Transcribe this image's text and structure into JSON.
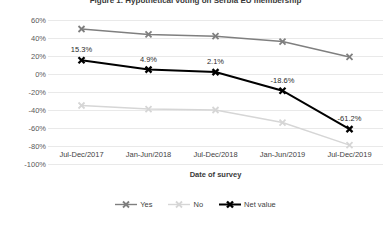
{
  "chart_data": {
    "type": "line",
    "title": "Figure 1. Hypothetical voting on Serbia EU membership",
    "xlabel": "Date of survey",
    "ylabel": "",
    "categories": [
      "Jul-Dec/2017",
      "Jan-Jun/2018",
      "Jul-Dec/2018",
      "Jan-Jun/2019",
      "Jul-Dec/2019"
    ],
    "ylim": [
      -100,
      60
    ],
    "ytick_labels": [
      "60%",
      "40%",
      "20%",
      "0%",
      "-20%",
      "-40%",
      "-60%",
      "-80%",
      "-100%"
    ],
    "ytick_values": [
      60,
      40,
      20,
      0,
      -20,
      -40,
      -60,
      -80,
      -100
    ],
    "grid": true,
    "legend_position": "bottom",
    "series": [
      {
        "name": "Yes",
        "color": "#7f7f7f",
        "values": [
          50.0,
          44.0,
          42.0,
          36.0,
          19.0
        ],
        "labels": [
          "",
          "",
          "",
          "",
          ""
        ]
      },
      {
        "name": "No",
        "color": "#d6d6d6",
        "values": [
          -35.0,
          -39.0,
          -40.0,
          -54.0,
          -79.0
        ],
        "labels": [
          "",
          "",
          "",
          "",
          ""
        ]
      },
      {
        "name": "Net value",
        "color": "#000000",
        "values": [
          15.3,
          4.9,
          2.1,
          -18.6,
          -61.2
        ],
        "labels": [
          "15.3%",
          "4.9%",
          "2.1%",
          "-18.6%",
          "-61.2%"
        ]
      }
    ]
  },
  "legend": {
    "items": [
      {
        "label": "Yes"
      },
      {
        "label": "No"
      },
      {
        "label": "Net value"
      }
    ]
  }
}
